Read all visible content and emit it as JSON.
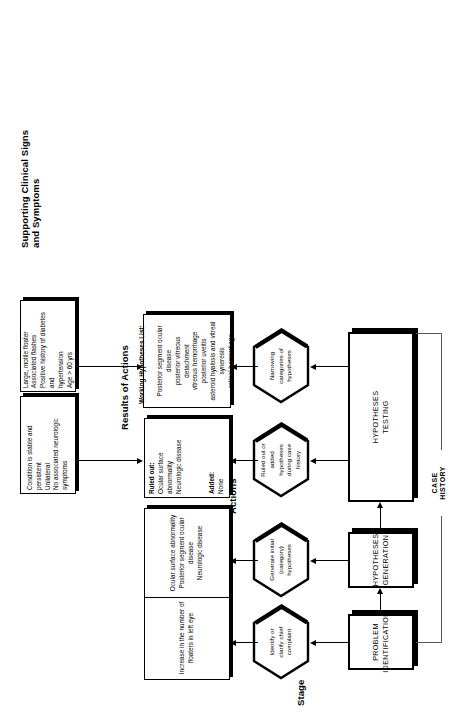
{
  "figure": {
    "orientation": "rotated-90-ccw",
    "case_history_label": "CASE\nHISTORY"
  },
  "columns": [
    {
      "id": "stage",
      "title": "Stage"
    },
    {
      "id": "actions",
      "title": "Actions"
    },
    {
      "id": "results",
      "title": "Results of Actions"
    },
    {
      "id": "signs",
      "title": "Supporting Clinical Signs\nand Symptoms"
    }
  ],
  "stages": [
    {
      "id": "problem-identification",
      "label": "PROBLEM\nIDENTIFICATION"
    },
    {
      "id": "hypotheses-generation",
      "label": "HYPOTHESES\nGENERATION"
    },
    {
      "id": "hypotheses-testing",
      "label": "HYPOTHESES\nTESTING"
    }
  ],
  "actions": [
    {
      "id": "identify-chief-complaint",
      "label": "Identify or\nclarify chief\ncomplaint"
    },
    {
      "id": "generate-initial-hypotheses",
      "label": "Generate initial\n(category)\nhypotheses"
    },
    {
      "id": "ruled-out-added-history",
      "label": "Ruled out or\nadded\nhypotheses\nduring case\nhistory"
    },
    {
      "id": "narrowing-categories",
      "label": "Narrowing\ncategories of\nhypotheses"
    }
  ],
  "results": [
    {
      "id": "increase-floaters",
      "text": "Increase in the number of\nfloaters in left eye"
    },
    {
      "id": "initial-category-hypotheses",
      "text": "Ocular surface abnormality\nPosterior segment ocular\ndisease\nNeurologic disease"
    },
    {
      "id": "ruled-out-added",
      "heading1": "Ruled out:",
      "body1": "Ocular surface abnormality\nNeurologic disease",
      "heading2": "Added:",
      "body2": "None"
    },
    {
      "id": "working-hypotheses-list",
      "heading1": "Working Hypotheses List:",
      "body1": "Posterior segment ocular\ndisease\nposterior vitreous\ndetachment\nvitreous hemorrhage\nposterior uveitis\nasteroid hyalosis and vitreal\nsyneresis\nretinal hemorrhage"
    }
  ],
  "signs": [
    {
      "id": "signs-ruled-out",
      "text": "Condition is stable and persistent\nUnilateral\nNo associated neurologic\nsymptoms"
    },
    {
      "id": "signs-working-hypotheses",
      "text": "Large, motile floater\nAssociated flashes\nPositive history of diabetes and\nhypertension\nAge > 60 yrs"
    }
  ]
}
